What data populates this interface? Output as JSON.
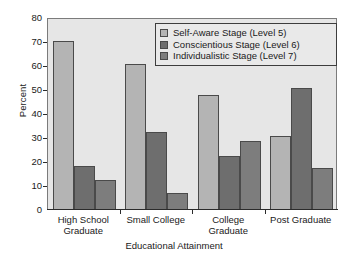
{
  "chart_data": {
    "type": "bar",
    "title": "",
    "xlabel": "Educational Attainment",
    "ylabel": "Percent",
    "ylim": [
      0,
      80
    ],
    "yticks": [
      0,
      10,
      20,
      30,
      40,
      50,
      60,
      70,
      80
    ],
    "grid": false,
    "legend_position": "top-right",
    "categories": [
      "High School\nGraduate",
      "Small College",
      "College\nGraduate",
      "Post Graduate"
    ],
    "series": [
      {
        "name": "Self-Aware Stage (Level 5)",
        "color": "#b4b4b4",
        "values": [
          70,
          60.5,
          47.5,
          30.5
        ]
      },
      {
        "name": "Conscientious Stage (Level 6)",
        "color": "#6e6e6e",
        "values": [
          18,
          32,
          22,
          50.5
        ]
      },
      {
        "name": "Individualistic Stage (Level 7)",
        "color": "#7d7d7d",
        "values": [
          12,
          6.5,
          28.5,
          17
        ]
      }
    ]
  },
  "colors": {
    "plot_background": "#e6e6e6",
    "page_background": "#ffffff",
    "axis": "#2b2b2b",
    "bar_outline": "#4a4a4a",
    "legend_background": "#e9e9e9",
    "legend_border": "#3d3d3d"
  }
}
